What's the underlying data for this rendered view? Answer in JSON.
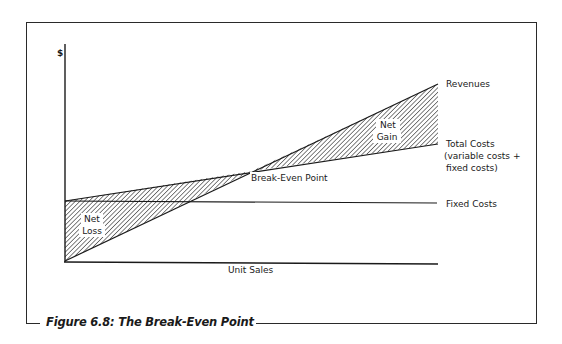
{
  "figure": {
    "caption": "Figure 6.8: The Break-Even Point",
    "y_axis_label": "$",
    "x_axis_label": "Unit Sales"
  },
  "lines": {
    "revenues": "Revenues",
    "total_costs": "Total Costs",
    "total_costs_note_line1": "(variable costs +",
    "total_costs_note_line2": "fixed costs)",
    "fixed_costs": "Fixed Costs"
  },
  "annotations": {
    "break_even": "Break-Even Point",
    "net_gain_line1": "Net",
    "net_gain_line2": "Gain",
    "net_loss_line1": "Net",
    "net_loss_line2": "Loss"
  },
  "colors": {
    "ink": "#1a1a1a",
    "background": "#ffffff"
  }
}
